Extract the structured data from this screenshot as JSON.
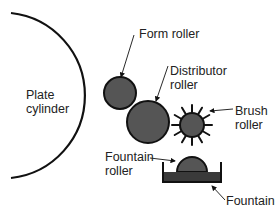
{
  "diagram": {
    "type": "offset press dampening system",
    "colors": {
      "roller_fill": "#555555",
      "stroke": "#111111",
      "fountain_solution": "#3a3a3a",
      "background": "#ffffff"
    },
    "labels": {
      "plate_cylinder": [
        "Plate",
        "cylinder"
      ],
      "form_roller": "Form roller",
      "distributor_roller": [
        "Distributor",
        "roller"
      ],
      "brush_roller": [
        "Brush",
        "roller"
      ],
      "fountain_roller": [
        "Fountain",
        "roller"
      ],
      "fountain": "Fountain"
    }
  }
}
